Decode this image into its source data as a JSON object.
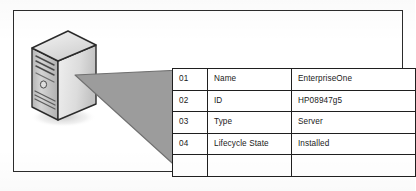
{
  "figure": {
    "illustration": {
      "device_label": "server-tower",
      "device_type": "Server",
      "colors": {
        "body_light": "#e8e8e8",
        "body_mid": "#c9c9c9",
        "body_dark": "#8f8f8f",
        "outline": "#2b2b2b",
        "wedge_fill": "#9a9a9a",
        "wedge_outline": "#6e6e6e",
        "frame_border": "#2b2b2b",
        "table_border": "#1f1f1f",
        "text": "#1a1a1a",
        "background": "#ffffff"
      }
    },
    "table": {
      "columns": [
        "index",
        "attribute",
        "value"
      ],
      "rows": [
        {
          "index": "01",
          "attribute": "Name",
          "value": "EnterpriseOne"
        },
        {
          "index": "02",
          "attribute": "ID",
          "value": "HP08947g5"
        },
        {
          "index": "03",
          "attribute": "Type",
          "value": "Server"
        },
        {
          "index": "04",
          "attribute": "Lifecycle State",
          "value": "Installed"
        },
        {
          "index": "",
          "attribute": "",
          "value": ""
        }
      ]
    }
  }
}
